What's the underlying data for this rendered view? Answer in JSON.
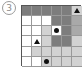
{
  "label": "3",
  "grid": {
    "rows": 6,
    "cols": 6,
    "legend": {
      "w": "white",
      "l": "light-gray",
      "m": "medium-gray",
      "d": "dark-gray"
    },
    "cells": [
      [
        "d",
        "d",
        "d",
        "d",
        "d",
        "l"
      ],
      [
        "w",
        "w",
        "w",
        "d",
        "d",
        "m"
      ],
      [
        "w",
        "w",
        "l",
        "w",
        "d",
        "m"
      ],
      [
        "w",
        "w",
        "l",
        "d",
        "d",
        "l"
      ],
      [
        "w",
        "l",
        "l",
        "l",
        "l",
        "l"
      ],
      [
        "w",
        "w",
        "l",
        "l",
        "l",
        "l"
      ]
    ],
    "markers": [
      {
        "row": 0,
        "col": 5,
        "type": "triangle"
      },
      {
        "row": 2,
        "col": 3,
        "type": "dot"
      },
      {
        "row": 3,
        "col": 1,
        "type": "triangle"
      },
      {
        "row": 5,
        "col": 2,
        "type": "dot"
      }
    ]
  }
}
